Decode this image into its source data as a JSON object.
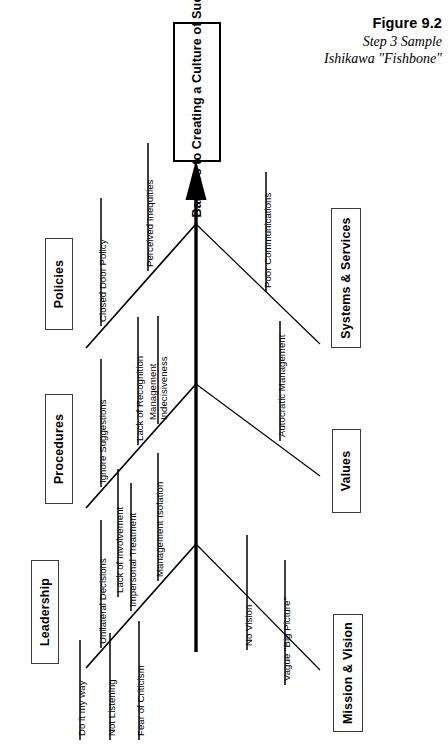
{
  "figure": {
    "caption_line1": "Figure 9.2",
    "caption_line2": "Step 3 Sample",
    "caption_line3": "Ishikawa \"Fishbone\""
  },
  "diagram": {
    "type": "ishikawa-fishbone",
    "orientation": "vertical-spine-arrow-up",
    "head": {
      "label": "Barriers to Creating a Culture of Success"
    },
    "categories": [
      {
        "id": "policies",
        "label": "Policies",
        "side": "left",
        "causes": [
          "Closed Door Policy",
          "Perceived Inequities"
        ]
      },
      {
        "id": "procedures",
        "label": "Procedures",
        "side": "left",
        "causes": [
          "Ignore Suggestions",
          "Lack of Recognition",
          "Management Indecisiveness",
          "Lack of Involvement"
        ]
      },
      {
        "id": "leadership",
        "label": "Leadership",
        "side": "left",
        "causes": [
          "Do it my way",
          "Unilateral Decisions",
          "Not Listening",
          "Impersonal Treatment",
          "Fear of Criticism",
          "Management Isolation"
        ]
      },
      {
        "id": "systems-services",
        "label": "Systems & Services",
        "side": "right",
        "causes": [
          "Poor Communications"
        ]
      },
      {
        "id": "values",
        "label": "Values",
        "side": "right",
        "causes": [
          "Autocratic Management"
        ]
      },
      {
        "id": "mission-vision",
        "label": "Mission & Vision",
        "side": "right",
        "causes": [
          "No Vision",
          "Vague \"Big Picture\""
        ]
      }
    ],
    "colors": {
      "line": "#000000",
      "box_border": "#3a3a3a",
      "head_border": "#000000",
      "background": "#ffffff",
      "text": "#000000"
    }
  }
}
